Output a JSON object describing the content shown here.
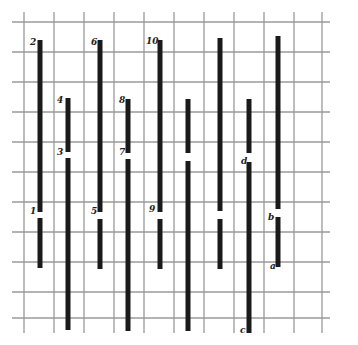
{
  "diagram": {
    "type": "bar-segment-grid",
    "colors": {
      "grid": "#9a9a9a",
      "bar": "#1a1a1a",
      "background": "#ffffff",
      "label": "#222222"
    },
    "grid": {
      "vertical_x": [
        24,
        54,
        84,
        114,
        144,
        174,
        204,
        234,
        264,
        294,
        322
      ],
      "vertical_y_range": [
        12,
        333
      ],
      "horizontal_y": [
        22,
        52,
        82,
        112,
        142,
        172,
        202,
        232,
        262,
        292,
        318
      ],
      "horizontal_x_range": [
        12,
        330
      ]
    },
    "bar_width": 5,
    "bars": [
      {
        "id": "2",
        "x": 40,
        "y1": 40,
        "y2": 212,
        "label": "2",
        "label_pos": "top"
      },
      {
        "id": "1",
        "x": 40,
        "y1": 218,
        "y2": 268,
        "label": "1",
        "label_pos": "top"
      },
      {
        "id": "4",
        "x": 68,
        "y1": 98,
        "y2": 152,
        "label": "4",
        "label_pos": "top"
      },
      {
        "id": "3",
        "x": 68,
        "y1": 158,
        "y2": 330,
        "label": "3",
        "label_pos": "top"
      },
      {
        "id": "6",
        "x": 100,
        "y1": 40,
        "y2": 212,
        "label": "6",
        "label_pos": "top"
      },
      {
        "id": "5",
        "x": 100,
        "y1": 219,
        "y2": 269,
        "label": "5",
        "label_pos": "top"
      },
      {
        "id": "8",
        "x": 128,
        "y1": 99,
        "y2": 153,
        "label": "8",
        "label_pos": "top"
      },
      {
        "id": "7",
        "x": 128,
        "y1": 159,
        "y2": 331,
        "label": "7",
        "label_pos": "top"
      },
      {
        "id": "10",
        "x": 160,
        "y1": 40,
        "y2": 212,
        "label": "10",
        "label_pos": "top"
      },
      {
        "id": "9",
        "x": 160,
        "y1": 219,
        "y2": 269,
        "label": "9",
        "label_pos": "top"
      },
      {
        "id": "u1",
        "x": 188,
        "y1": 99,
        "y2": 153,
        "label": "",
        "label_pos": "top"
      },
      {
        "id": "u2",
        "x": 188,
        "y1": 161,
        "y2": 331,
        "label": "",
        "label_pos": "top"
      },
      {
        "id": "u3",
        "x": 220,
        "y1": 38,
        "y2": 211,
        "label": "",
        "label_pos": "top"
      },
      {
        "id": "u4",
        "x": 220,
        "y1": 219,
        "y2": 269,
        "label": "",
        "label_pos": "top"
      },
      {
        "id": "u5",
        "x": 249,
        "y1": 99,
        "y2": 153,
        "label": "",
        "label_pos": "top"
      },
      {
        "id": "d",
        "x": 249,
        "y1": 162,
        "y2": 333,
        "label": "d",
        "label_pos": "top"
      },
      {
        "id": "u6",
        "x": 278,
        "y1": 36,
        "y2": 209,
        "label": "",
        "label_pos": "top"
      },
      {
        "id": "b",
        "x": 278,
        "y1": 217,
        "y2": 267,
        "label": "b",
        "label_pos": "top"
      },
      {
        "id": "a",
        "x": 278,
        "y1": 217,
        "y2": 267,
        "label": "a",
        "label_pos": "bottom"
      },
      {
        "id": "c",
        "x": 249,
        "y1": 162,
        "y2": 333,
        "label": "c",
        "label_pos": "bottom"
      }
    ],
    "labels": [
      {
        "text": "2",
        "x": 30,
        "y": 45
      },
      {
        "text": "1",
        "x": 30,
        "y": 214
      },
      {
        "text": "4",
        "x": 57,
        "y": 103
      },
      {
        "text": "3",
        "x": 57,
        "y": 155
      },
      {
        "text": "6",
        "x": 91,
        "y": 45
      },
      {
        "text": "5",
        "x": 91,
        "y": 214
      },
      {
        "text": "8",
        "x": 119,
        "y": 103
      },
      {
        "text": "7",
        "x": 119,
        "y": 155
      },
      {
        "text": "10",
        "x": 146,
        "y": 44
      },
      {
        "text": "9",
        "x": 149,
        "y": 212
      },
      {
        "text": "d",
        "x": 241,
        "y": 164
      },
      {
        "text": "b",
        "x": 268,
        "y": 220
      },
      {
        "text": "a",
        "x": 270,
        "y": 269
      },
      {
        "text": "c",
        "x": 240,
        "y": 333
      }
    ]
  }
}
